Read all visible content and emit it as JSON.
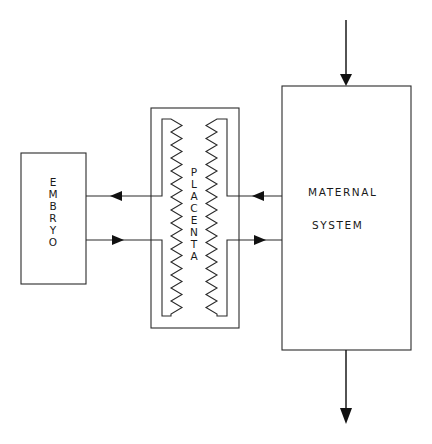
{
  "diagram": {
    "nodes": {
      "embryo": {
        "label": "EMBRYO",
        "orientation": "vertical"
      },
      "placenta": {
        "label": "PLACENTA",
        "orientation": "vertical"
      },
      "maternal_system": {
        "line1": "MATERNAL",
        "line2": "SYSTEM"
      }
    },
    "edges": [
      {
        "from": "external",
        "to": "maternal_system",
        "direction": "down"
      },
      {
        "from": "maternal_system",
        "to": "placenta",
        "direction": "left"
      },
      {
        "from": "placenta",
        "to": "embryo",
        "direction": "left"
      },
      {
        "from": "embryo",
        "to": "placenta",
        "direction": "right"
      },
      {
        "from": "placenta",
        "to": "maternal_system",
        "direction": "right"
      },
      {
        "from": "maternal_system",
        "to": "external",
        "direction": "down"
      }
    ],
    "colors": {
      "line": "#2a2a2a",
      "background": "#ffffff"
    }
  }
}
